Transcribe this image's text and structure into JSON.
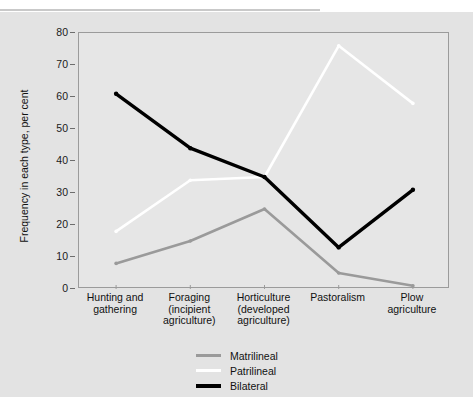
{
  "chart_data": {
    "type": "line",
    "title": "",
    "xlabel": "",
    "ylabel": "Frequency in each type, per cent",
    "ylim": [
      0,
      80
    ],
    "ytick_step": 10,
    "yticks": [
      0,
      10,
      20,
      30,
      40,
      50,
      60,
      70,
      80
    ],
    "grid": false,
    "legend_position": "bottom",
    "categories": [
      "Hunting and gathering",
      "Foraging (incipient agriculture)",
      "Horticulture (developed agriculture)",
      "Pastoralism",
      "Plow agriculture"
    ],
    "category_label_lines": [
      [
        "Hunting and",
        "gathering"
      ],
      [
        "Foraging",
        "(incipient",
        "agriculture)"
      ],
      [
        "Horticulture",
        "(developed",
        "agriculture)"
      ],
      [
        "Pastoralism"
      ],
      [
        "Plow",
        "agriculture"
      ]
    ],
    "series": [
      {
        "name": "Matrilineal",
        "color": "#9a9a9a",
        "values": [
          8,
          15,
          25,
          5,
          1
        ]
      },
      {
        "name": "Patrilineal",
        "color": "#ffffff",
        "values": [
          18,
          34,
          35,
          76,
          58
        ]
      },
      {
        "name": "Bilateral",
        "color": "#000000",
        "values": [
          61,
          44,
          35,
          13,
          31
        ]
      }
    ]
  },
  "legend": {
    "items": [
      {
        "label": "Matrilineal",
        "color": "#9a9a9a"
      },
      {
        "label": "Patrilineal",
        "color": "#ffffff"
      },
      {
        "label": "Bilateral",
        "color": "#000000"
      }
    ]
  },
  "colors": {
    "figure_background": "#e3e3e3",
    "plot_background": "#e6e6e6",
    "axis": "#9b9b9b",
    "text": "#111111"
  }
}
